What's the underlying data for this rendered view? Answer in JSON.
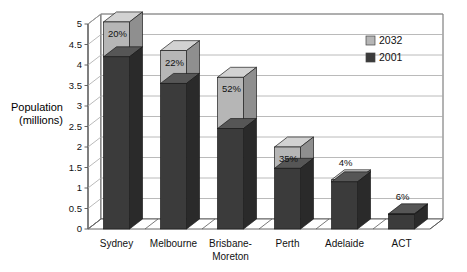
{
  "chart_data": {
    "type": "bar",
    "subtype": "stacked-3d-column",
    "title": "",
    "xlabel": "",
    "ylabel": "Population (millions)",
    "ylabel_lines": [
      "Population",
      "(millions)"
    ],
    "ylim": [
      0,
      5
    ],
    "ytick_step": 0.5,
    "ytick_labels": [
      "0",
      "0.5",
      "1",
      "1.5",
      "2",
      "2.5",
      "3",
      "3.5",
      "4",
      "4.5",
      "5"
    ],
    "ytick_values": [
      0,
      0.5,
      1,
      1.5,
      2,
      2.5,
      3,
      3.5,
      4,
      4.5,
      5
    ],
    "grid": true,
    "grid_orientation": "horizontal",
    "legend_position": "inside-top-right",
    "categories": [
      "Sydney",
      "Melbourne",
      "Brisbane-Moreton",
      "Perth",
      "Adelaide",
      "ACT"
    ],
    "category_label_lines": [
      [
        "Sydney"
      ],
      [
        "Melbourne"
      ],
      [
        "Brisbane-",
        "Moreton"
      ],
      [
        "Perth"
      ],
      [
        "Adelaide"
      ],
      [
        "ACT"
      ]
    ],
    "series": [
      {
        "name": "2001",
        "color": "#3b3b3b",
        "values": [
          4.2,
          3.55,
          2.45,
          1.48,
          1.15,
          0.35
        ]
      },
      {
        "name": "2032",
        "color": "#b6b6b6",
        "values": [
          0.85,
          0.8,
          1.25,
          0.52,
          0.05,
          0.02
        ]
      }
    ],
    "totals": [
      5.05,
      4.35,
      3.7,
      2.0,
      1.2,
      0.37
    ],
    "growth_labels": [
      "20%",
      "22%",
      "52%",
      "35%",
      "4%",
      "6%"
    ],
    "growth_label_placement": [
      "inside-top",
      "inside-top",
      "inside-top",
      "inside-top",
      "above-bar",
      "above-bar"
    ]
  },
  "legend": {
    "entries": [
      {
        "label": "2032",
        "color": "#b6b6b6"
      },
      {
        "label": "2001",
        "color": "#3b3b3b"
      }
    ]
  },
  "colors": {
    "series_2032_front": "#b6b6b6",
    "series_2032_side": "#8f8f8f",
    "series_2032_top": "#d2d2d2",
    "series_2001_front": "#3b3b3b",
    "series_2001_side": "#2a2a2a",
    "series_2001_top": "#565656",
    "grid": "#a8a8a8",
    "axis": "#555555",
    "wall": "#ffffff",
    "text": "#111111"
  }
}
